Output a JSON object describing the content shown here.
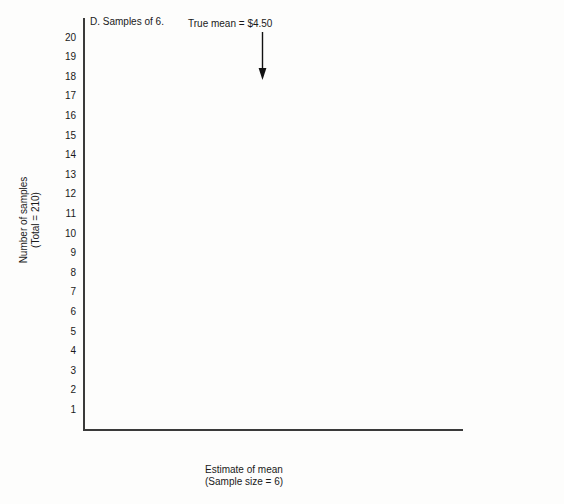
{
  "panel": {
    "label": "D. Samples of 6."
  },
  "annotation": {
    "text": "True mean = $4.50",
    "arrow_icon": "down-arrow-icon",
    "value": 4.5
  },
  "axes": {
    "y_title_line1": "Number of samples",
    "y_title_line2": "(Total = 210)",
    "x_title_line1": "Estimate of mean",
    "x_title_line2": "(Sample size = 6)",
    "y_ticks": [
      "1",
      "2",
      "3",
      "4",
      "5",
      "6",
      "7",
      "8",
      "9",
      "10",
      "11",
      "12",
      "13",
      "14",
      "15",
      "16",
      "17",
      "18",
      "19",
      "20"
    ],
    "x_ticks": [
      "$0",
      "$1",
      "$2",
      "$3",
      "$4",
      "$5",
      "$6",
      "$7",
      "$8",
      "$9"
    ]
  },
  "chart_data": {
    "type": "scatter",
    "plot_style": "dot-plot-stacked",
    "title": "D. Samples of 6.",
    "xlabel": "Estimate of mean (Sample size = 6)",
    "ylabel": "Number of samples (Total = 210)",
    "xlim": [
      0,
      9
    ],
    "ylim": [
      0,
      20
    ],
    "grid": false,
    "legend": null,
    "total_samples": 210,
    "sample_size": 6,
    "true_mean": 4.5,
    "annotation_text": "True mean = $4.50",
    "x_tick_values": [
      0,
      1,
      2,
      3,
      4,
      5,
      6,
      7,
      8,
      9
    ],
    "x_tick_labels": [
      "$0",
      "$1",
      "$2",
      "$3",
      "$4",
      "$5",
      "$6",
      "$7",
      "$8",
      "$9"
    ],
    "y_tick_values": [
      1,
      2,
      3,
      4,
      5,
      6,
      7,
      8,
      9,
      10,
      11,
      12,
      13,
      14,
      15,
      16,
      17,
      18,
      19,
      20
    ],
    "dot_value_step": 0.1667,
    "rows": [
      {
        "y": 1,
        "count": 27,
        "x_start": 2.45,
        "x_end": 6.78
      },
      {
        "y": 2,
        "count": 23,
        "x_start": 2.78,
        "x_end": 6.45
      },
      {
        "y": 3,
        "count": 23,
        "x_start": 2.78,
        "x_end": 6.45
      },
      {
        "y": 4,
        "count": 21,
        "x_start": 2.95,
        "x_end": 6.28
      },
      {
        "y": 5,
        "count": 19,
        "x_start": 3.12,
        "x_end": 6.12
      },
      {
        "y": 6,
        "count": 19,
        "x_start": 3.12,
        "x_end": 6.12
      },
      {
        "y": 7,
        "count": 15,
        "x_start": 3.45,
        "x_end": 5.78
      },
      {
        "y": 8,
        "count": 15,
        "x_start": 3.45,
        "x_end": 5.78
      },
      {
        "y": 9,
        "count": 13,
        "x_start": 3.62,
        "x_end": 5.62
      },
      {
        "y": 10,
        "count": 11,
        "x_start": 3.78,
        "x_end": 5.45
      },
      {
        "y": 11,
        "count": 9,
        "x_start": 3.95,
        "x_end": 5.28
      },
      {
        "y": 12,
        "count": 9,
        "x_start": 3.95,
        "x_end": 5.28
      },
      {
        "y": 13,
        "count": 9,
        "x_start": 3.95,
        "x_end": 5.28
      },
      {
        "y": 14,
        "count": 7,
        "x_start": 4.12,
        "x_end": 5.12
      },
      {
        "y": 15,
        "count": 5,
        "x_start": 4.28,
        "x_end": 4.95
      },
      {
        "y": 16,
        "count": 5,
        "x_start": 4.28,
        "x_end": 4.95
      },
      {
        "y": 17,
        "count": 1,
        "x_start": 4.5,
        "x_end": 4.5
      },
      {
        "y": 18,
        "count": 1,
        "x_start": 4.5,
        "x_end": 4.5
      },
      {
        "y": 19,
        "count": 0,
        "x_start": null,
        "x_end": null
      },
      {
        "y": 20,
        "count": 0,
        "x_start": null,
        "x_end": null
      }
    ]
  },
  "geometry": {
    "x0_px": 64,
    "px_per_dollar": 42.1,
    "y1_px": 410,
    "px_per_unit": 19.6
  }
}
